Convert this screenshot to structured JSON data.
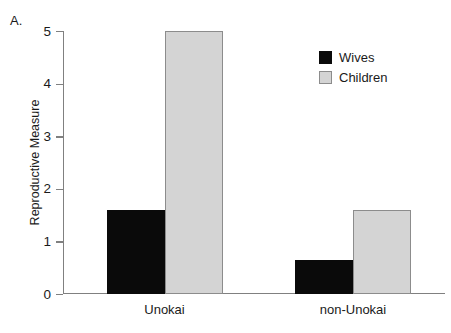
{
  "panel": {
    "label": "A."
  },
  "chart_data": {
    "type": "bar",
    "title": "",
    "subtitle": "",
    "xlabel": "",
    "ylabel": "Reproductive Measure",
    "categories": [
      "Unokai",
      "non-Unokai"
    ],
    "series": [
      {
        "name": "Wives",
        "color": "#0a0a0a",
        "values": [
          1.6,
          0.65
        ]
      },
      {
        "name": "Children",
        "color": "#d4d4d4",
        "values": [
          5.0,
          1.6
        ]
      }
    ],
    "ylim": [
      0,
      5
    ],
    "yticks": [
      0,
      1,
      2,
      3,
      4,
      5
    ],
    "ytick_labels": [
      "0",
      "1",
      "2",
      "3",
      "4",
      "5"
    ],
    "grid": false,
    "legend_position": "top-right",
    "legend_entries": [
      "Wives",
      "Children"
    ]
  },
  "colors": {
    "wives": "#0a0a0a",
    "children": "#d4d4d4",
    "children_border": "#8c8c8c",
    "axis": "#808080",
    "text": "#1a1a1a",
    "background": "#ffffff"
  }
}
